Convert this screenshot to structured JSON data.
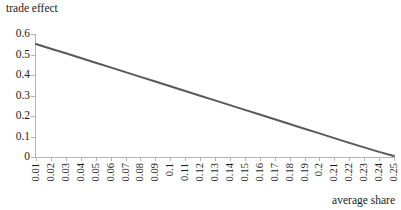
{
  "chart_data": {
    "type": "line",
    "title": "",
    "ylabel": "trade effect",
    "xlabel": "average share",
    "xlim": [
      0.01,
      0.25
    ],
    "ylim": [
      0,
      0.6
    ],
    "grid": false,
    "legend": null,
    "y_ticks": [
      "0.6",
      "0.5",
      "0.4",
      "0.3",
      "0.2",
      "0.1",
      "0"
    ],
    "y_tick_values": [
      0.6,
      0.5,
      0.4,
      0.3,
      0.2,
      0.1,
      0
    ],
    "categories": [
      "0.01",
      "0.02",
      "0.03",
      "0.04",
      "0.05",
      "0.06",
      "0.07",
      "0.08",
      "0.09",
      "0.1",
      "0.11",
      "0.12",
      "0.13",
      "0.14",
      "0.15",
      "0.16",
      "0.17",
      "0.18",
      "0.19",
      "0.2",
      "0.21",
      "0.22",
      "0.23",
      "0.24",
      "0.25"
    ],
    "x": [
      0.01,
      0.02,
      0.03,
      0.04,
      0.05,
      0.06,
      0.07,
      0.08,
      0.09,
      0.1,
      0.11,
      0.12,
      0.13,
      0.14,
      0.15,
      0.16,
      0.17,
      0.18,
      0.19,
      0.2,
      0.21,
      0.22,
      0.23,
      0.24,
      0.25
    ],
    "values": [
      0.551,
      0.528,
      0.506,
      0.483,
      0.46,
      0.437,
      0.414,
      0.391,
      0.368,
      0.345,
      0.322,
      0.299,
      0.276,
      0.253,
      0.23,
      0.207,
      0.184,
      0.161,
      0.138,
      0.115,
      0.092,
      0.069,
      0.047,
      0.025,
      0.005
    ],
    "line_color": "#595959",
    "axis_color": "#b3b3b3",
    "line_width": 2,
    "background": "#ffffff"
  }
}
